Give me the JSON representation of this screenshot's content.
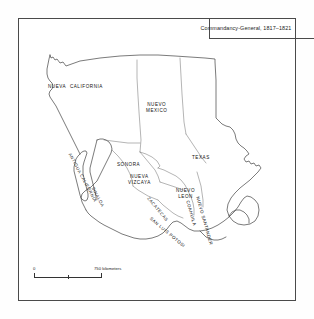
{
  "title": "Commandancy-General, 1817–1821",
  "map": {
    "regions": [
      {
        "id": "nueva-california",
        "label": "NUEVA  CALIFORNIA",
        "x": 48,
        "y": 84,
        "rotate": 0
      },
      {
        "id": "nuevo-mexico",
        "label": "NUEVO\nMEXICO",
        "x": 146,
        "y": 102,
        "rotate": 0
      },
      {
        "id": "sonora",
        "label": "SONORA",
        "x": 117,
        "y": 162,
        "rotate": 0
      },
      {
        "id": "texas",
        "label": "TEXAS",
        "x": 192,
        "y": 155,
        "rotate": 0
      },
      {
        "id": "nueva-vizcaya",
        "label": "NUEVA\nVIZCAYA",
        "x": 128,
        "y": 174,
        "rotate": 0
      },
      {
        "id": "nuevo-leon",
        "label": "NUEVO\nLEON",
        "x": 176,
        "y": 188,
        "rotate": 0
      },
      {
        "id": "antigua-california",
        "label": "ANTIGUA CALIFORNIA",
        "x": 72,
        "y": 152,
        "rotate": 62
      },
      {
        "id": "sinaloa",
        "label": "SINALOA",
        "x": 95,
        "y": 186,
        "rotate": 62
      },
      {
        "id": "zacatecas",
        "label": "ZACATECAS",
        "x": 150,
        "y": 196,
        "rotate": 50
      },
      {
        "id": "san-luis-potosi",
        "label": "SAN LUIS POTOSI",
        "x": 152,
        "y": 216,
        "rotate": 40
      },
      {
        "id": "coahuila",
        "label": "COAHUILA",
        "x": 190,
        "y": 200,
        "rotate": 74
      },
      {
        "id": "nuevo-santander",
        "label": "NUEVO SANTANDER",
        "x": 200,
        "y": 196,
        "rotate": 74
      }
    ]
  },
  "scale": {
    "start_label": "0",
    "end_label": "750 kilometers"
  },
  "colors": {
    "border": "#4a4a4a",
    "coastline": "#333333",
    "internal_border": "#666666",
    "text": "#111111",
    "background": "#ffffff"
  }
}
